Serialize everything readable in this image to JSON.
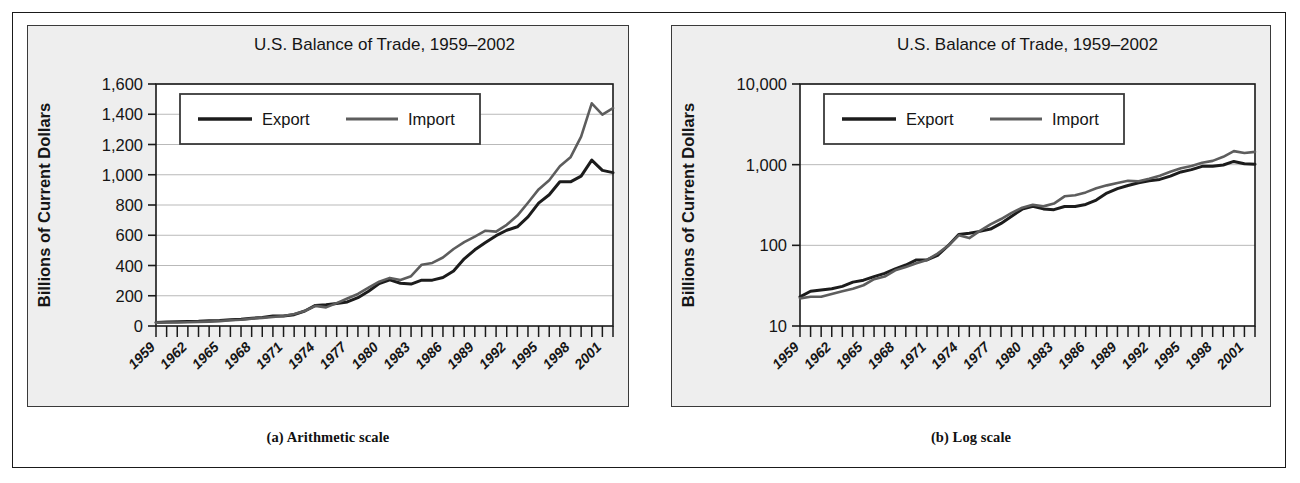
{
  "figure": {
    "panels": [
      {
        "key": "arithmetic",
        "caption": "(a) Arithmetic scale",
        "title": "U.S. Balance of Trade, 1959–2002",
        "ylabel": "Billions of Current Dollars",
        "legend": {
          "export_label": "Export",
          "import_label": "Import"
        }
      },
      {
        "key": "log",
        "caption": "(b) Log scale",
        "title": "U.S. Balance of Trade, 1959–2002",
        "ylabel": "Billions of Current Dollars",
        "legend": {
          "export_label": "Export",
          "import_label": "Import"
        }
      }
    ]
  },
  "colors": {
    "export_line": "#1c1c1c",
    "import_line": "#5d5d5d",
    "grid": "#b9b9b9",
    "axis": "#1a1a1a",
    "panel_bg": "#eeeeee",
    "plot_bg": "#ffffff",
    "frame": "#1a1a1a"
  },
  "chart_data": [
    {
      "type": "line",
      "scale": "linear",
      "title": "U.S. Balance of Trade, 1959–2002",
      "xlabel": "",
      "ylabel": "Billions of Current Dollars",
      "ylim": [
        0,
        1600
      ],
      "yticks": [
        0,
        200,
        400,
        600,
        800,
        1000,
        1200,
        1400,
        1600
      ],
      "ytick_labels": [
        "0",
        "200",
        "400",
        "600",
        "800",
        "1,000",
        "1,200",
        "1,400",
        "1,600"
      ],
      "xlim": [
        1959,
        2002
      ],
      "xticks": [
        1959,
        1962,
        1965,
        1968,
        1971,
        1974,
        1977,
        1980,
        1983,
        1986,
        1989,
        1992,
        1995,
        1998,
        2001
      ],
      "xtick_labels": [
        "1959",
        "1962",
        "1965",
        "1968",
        "1971",
        "1974",
        "1977",
        "1980",
        "1983",
        "1986",
        "1989",
        "1992",
        "1995",
        "1998",
        "2001"
      ],
      "minor_xtick_interval": 1,
      "grid": "horizontal",
      "legend_position": "top-left-inside",
      "x": [
        1959,
        1960,
        1961,
        1962,
        1963,
        1964,
        1965,
        1966,
        1967,
        1968,
        1969,
        1970,
        1971,
        1972,
        1973,
        1974,
        1975,
        1976,
        1977,
        1978,
        1979,
        1980,
        1981,
        1982,
        1983,
        1984,
        1985,
        1986,
        1987,
        1988,
        1989,
        1990,
        1991,
        1992,
        1993,
        1994,
        1995,
        1996,
        1997,
        1998,
        1999,
        2000,
        2001,
        2002
      ],
      "series": [
        {
          "name": "Export",
          "values": [
            23,
            27,
            28,
            29,
            31,
            35,
            37,
            41,
            45,
            51,
            57,
            66,
            66,
            75,
            99,
            136,
            141,
            149,
            159,
            187,
            230,
            281,
            305,
            283,
            277,
            303,
            303,
            321,
            364,
            444,
            504,
            552,
            597,
            633,
            656,
            721,
            812,
            868,
            954,
            953,
            991,
            1097,
            1029,
            1014
          ]
        },
        {
          "name": "Import",
          "values": [
            22,
            23,
            23,
            25,
            27,
            29,
            32,
            38,
            41,
            49,
            54,
            60,
            66,
            79,
            99,
            133,
            123,
            151,
            182,
            212,
            253,
            293,
            318,
            304,
            329,
            405,
            417,
            453,
            509,
            554,
            591,
            630,
            624,
            669,
            730,
            815,
            903,
            964,
            1056,
            1115,
            1252,
            1472,
            1398,
            1441
          ]
        }
      ]
    },
    {
      "type": "line",
      "scale": "log",
      "title": "U.S. Balance of Trade, 1959–2002",
      "xlabel": "",
      "ylabel": "Billions of Current Dollars",
      "ylim": [
        10,
        10000
      ],
      "yticks": [
        10,
        100,
        1000,
        10000
      ],
      "ytick_labels": [
        "10",
        "100",
        "1,000",
        "10,000"
      ],
      "xlim": [
        1959,
        2002
      ],
      "xticks": [
        1959,
        1962,
        1965,
        1968,
        1971,
        1974,
        1977,
        1980,
        1983,
        1986,
        1989,
        1992,
        1995,
        1998,
        2001
      ],
      "xtick_labels": [
        "1959",
        "1962",
        "1965",
        "1968",
        "1971",
        "1974",
        "1977",
        "1980",
        "1983",
        "1986",
        "1989",
        "1992",
        "1995",
        "1998",
        "2001"
      ],
      "minor_xtick_interval": 1,
      "grid": "horizontal",
      "legend_position": "top-left-inside",
      "x": [
        1959,
        1960,
        1961,
        1962,
        1963,
        1964,
        1965,
        1966,
        1967,
        1968,
        1969,
        1970,
        1971,
        1972,
        1973,
        1974,
        1975,
        1976,
        1977,
        1978,
        1979,
        1980,
        1981,
        1982,
        1983,
        1984,
        1985,
        1986,
        1987,
        1988,
        1989,
        1990,
        1991,
        1992,
        1993,
        1994,
        1995,
        1996,
        1997,
        1998,
        1999,
        2000,
        2001,
        2002
      ],
      "series": [
        {
          "name": "Export",
          "values": [
            23,
            27,
            28,
            29,
            31,
            35,
            37,
            41,
            45,
            51,
            57,
            66,
            66,
            75,
            99,
            136,
            141,
            149,
            159,
            187,
            230,
            281,
            305,
            283,
            277,
            303,
            303,
            321,
            364,
            444,
            504,
            552,
            597,
            633,
            656,
            721,
            812,
            868,
            954,
            953,
            991,
            1097,
            1029,
            1014
          ]
        },
        {
          "name": "Import",
          "values": [
            22,
            23,
            23,
            25,
            27,
            29,
            32,
            38,
            41,
            49,
            54,
            60,
            66,
            79,
            99,
            133,
            123,
            151,
            182,
            212,
            253,
            293,
            318,
            304,
            329,
            405,
            417,
            453,
            509,
            554,
            591,
            630,
            624,
            669,
            730,
            815,
            903,
            964,
            1056,
            1115,
            1252,
            1472,
            1398,
            1441
          ]
        }
      ]
    }
  ]
}
